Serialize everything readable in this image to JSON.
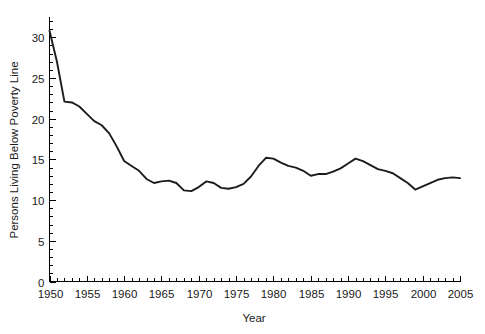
{
  "chart_data": {
    "type": "line",
    "title": "",
    "xlabel": "Year",
    "ylabel": "Persons Living Below Poverty Line",
    "xlim": [
      1950,
      2005
    ],
    "ylim": [
      0,
      32.5
    ],
    "grid": false,
    "legend": false,
    "line_color": "#1c1c1c",
    "background_color": "#ffffff",
    "x_ticks_major": [
      1950,
      1955,
      1960,
      1965,
      1970,
      1975,
      1980,
      1985,
      1990,
      1995,
      2000,
      2005
    ],
    "x_tick_labels": [
      "1950",
      "1955",
      "1960",
      "1965",
      "1970",
      "1975",
      "1980",
      "1985",
      "1990",
      "1995",
      "2000",
      "2005"
    ],
    "x_tick_minor_step": 1,
    "y_ticks_major": [
      0,
      5,
      10,
      15,
      20,
      25,
      30
    ],
    "y_tick_labels": [
      "0",
      "5",
      "10",
      "15",
      "20",
      "25",
      "30"
    ],
    "y_tick_minor_step": 1,
    "x": [
      1950,
      1951,
      1952,
      1953,
      1954,
      1955,
      1956,
      1957,
      1958,
      1959,
      1960,
      1961,
      1962,
      1963,
      1964,
      1965,
      1966,
      1967,
      1968,
      1969,
      1970,
      1971,
      1972,
      1973,
      1974,
      1975,
      1976,
      1977,
      1978,
      1979,
      1980,
      1981,
      1982,
      1983,
      1984,
      1985,
      1986,
      1987,
      1988,
      1989,
      1990,
      1991,
      1992,
      1993,
      1994,
      1995,
      1996,
      1997,
      1998,
      1999,
      2000,
      2001,
      2002,
      2003,
      2004,
      2005
    ],
    "values": [
      30.8,
      27.0,
      22.1,
      22.0,
      21.5,
      20.6,
      19.7,
      19.2,
      18.2,
      16.6,
      14.8,
      14.2,
      13.6,
      12.6,
      12.1,
      12.3,
      12.4,
      12.1,
      11.2,
      11.1,
      11.6,
      12.3,
      12.1,
      11.5,
      11.4,
      11.6,
      12.0,
      12.9,
      14.2,
      15.2,
      15.1,
      14.6,
      14.2,
      14.0,
      13.6,
      13.0,
      13.2,
      13.2,
      13.5,
      13.9,
      14.5,
      15.1,
      14.8,
      14.3,
      13.8,
      13.6,
      13.3,
      12.7,
      12.1,
      11.3,
      11.7,
      12.1,
      12.5,
      12.7,
      12.8,
      12.7
    ]
  }
}
